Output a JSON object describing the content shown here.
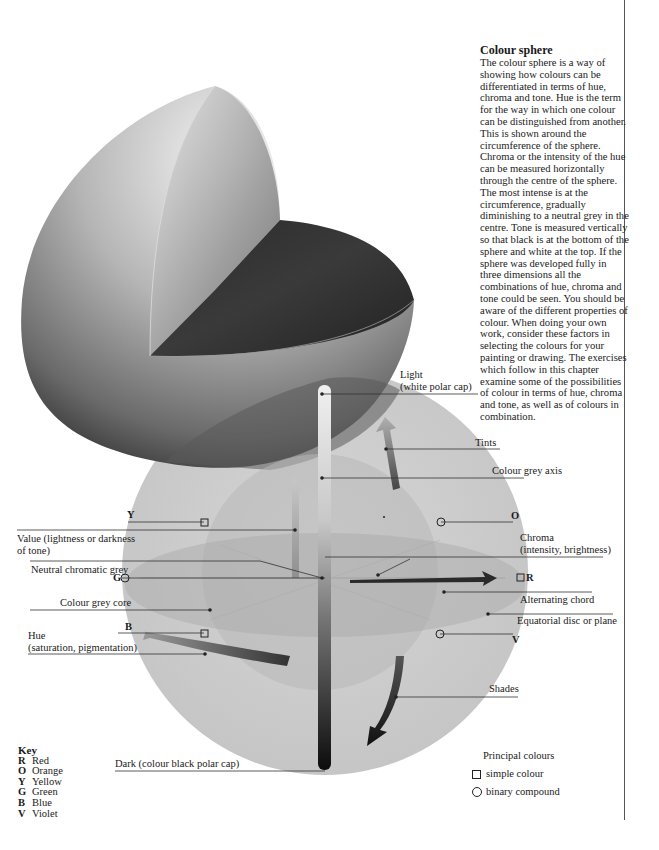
{
  "article": {
    "title": "Colour sphere",
    "body": "The colour sphere is a way of showing how colours can be differentiated in terms of hue, chroma and tone. Hue is the term for the way in which one colour can be distinguished from another. This is shown around the circumference of the sphere. Chroma or the intensity of the hue can be measured horizontally through the centre of the sphere. The most intense is at the circumference, gradually diminishing to a neutral grey in the centre. Tone is measured vertically so that black is at the bottom of the sphere and white at the top. If the sphere was developed fully in three dimensions all the combinations of hue, chroma and tone could be seen. You should be aware of the different properties of colour. When doing your own work, consider these factors in selecting the colours for your painting or drawing. The exercises which follow in this chapter examine some of the possibilities of colour in terms of hue, chroma and tone, as well as of colours in combination."
  },
  "labels": {
    "light": "Light",
    "light_sub": "(white polar cap)",
    "tints": "Tints",
    "colour_grey_axis": "Colour grey axis",
    "value": "Value (lightness or darkness",
    "value_sub": "of tone)",
    "neutral_chromatic_grey": "Neutral chromatic grey",
    "colour_grey_core": "Colour grey core",
    "hue": "Hue",
    "hue_sub": "(saturation, pigmentation)",
    "chroma": "Chroma",
    "chroma_sub": "(intensity, brightness)",
    "alternating_chord": "Alternating chord",
    "equatorial_disc": "Equatorial disc or plane",
    "shades": "Shades",
    "dark": "Dark (colour black polar cap)"
  },
  "hue_markers": {
    "Y": "Y",
    "O": "O",
    "G": "G",
    "R": "R",
    "B": "B",
    "V": "V"
  },
  "key": {
    "title": "Key",
    "items": [
      {
        "code": "R",
        "name": "Red"
      },
      {
        "code": "O",
        "name": "Orange"
      },
      {
        "code": "Y",
        "name": "Yellow"
      },
      {
        "code": "G",
        "name": "Green"
      },
      {
        "code": "B",
        "name": "Blue"
      },
      {
        "code": "V",
        "name": "Violet"
      }
    ]
  },
  "legend": {
    "title": "Principal colours",
    "simple": "simple colour",
    "binary": "binary compound"
  }
}
